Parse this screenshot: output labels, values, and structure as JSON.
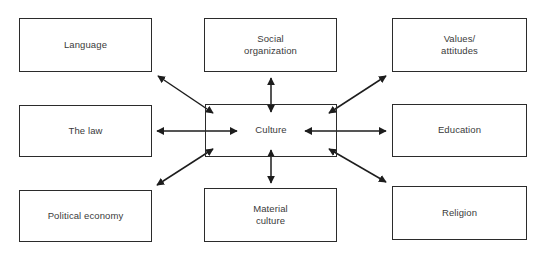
{
  "diagram": {
    "type": "hub-and-spoke",
    "background_color": "#ffffff",
    "line_color": "#2b2b2b",
    "text_color": "#3a3a3a",
    "center": {
      "label": "Culture",
      "x": 205,
      "y": 104,
      "width": 132,
      "height": 53
    },
    "nodes": [
      {
        "id": "language",
        "label": "Language",
        "x": 19,
        "y": 18,
        "width": 133,
        "height": 54,
        "arrow": "double",
        "direction": "diagonal-upper-left"
      },
      {
        "id": "social-organization",
        "label": "Social\norganization",
        "x": 204,
        "y": 18,
        "width": 133,
        "height": 54,
        "arrow": "double",
        "direction": "vertical-up"
      },
      {
        "id": "values-attitudes",
        "label": "Values/\nattitudes",
        "x": 392,
        "y": 18,
        "width": 135,
        "height": 54,
        "arrow": "double",
        "direction": "diagonal-upper-right"
      },
      {
        "id": "the-law",
        "label": "The law",
        "x": 19,
        "y": 105,
        "width": 133,
        "height": 52,
        "arrow": "double",
        "direction": "horizontal-left"
      },
      {
        "id": "education",
        "label": "Education",
        "x": 392,
        "y": 104,
        "width": 135,
        "height": 53,
        "arrow": "double",
        "direction": "horizontal-right"
      },
      {
        "id": "political-economy",
        "label": "Political economy",
        "x": 19,
        "y": 190,
        "width": 133,
        "height": 52,
        "arrow": "double",
        "direction": "diagonal-lower-left"
      },
      {
        "id": "material-culture",
        "label": "Material\nculture",
        "x": 204,
        "y": 188,
        "width": 133,
        "height": 54,
        "arrow": "double",
        "direction": "vertical-down"
      },
      {
        "id": "religion",
        "label": "Religion",
        "x": 392,
        "y": 186,
        "width": 135,
        "height": 54,
        "arrow": "double",
        "direction": "diagonal-lower-right"
      }
    ],
    "connectors": [
      {
        "id": "conn-language",
        "from": "culture",
        "to": "language",
        "heads": "both",
        "x1": 213,
        "y1": 113,
        "x2": 158,
        "y2": 76
      },
      {
        "id": "conn-social-organization",
        "from": "culture",
        "to": "social-organization",
        "heads": "both",
        "x1": 271,
        "y1": 112,
        "x2": 271,
        "y2": 78
      },
      {
        "id": "conn-values-attitudes",
        "from": "culture",
        "to": "values-attitudes",
        "heads": "both",
        "x1": 329,
        "y1": 113,
        "x2": 386,
        "y2": 76
      },
      {
        "id": "conn-the-law",
        "from": "culture",
        "to": "the-law",
        "heads": "both",
        "x1": 237,
        "y1": 131,
        "x2": 157,
        "y2": 131
      },
      {
        "id": "conn-education",
        "from": "culture",
        "to": "education",
        "heads": "both",
        "x1": 305,
        "y1": 131,
        "x2": 386,
        "y2": 131
      },
      {
        "id": "conn-political-economy",
        "from": "culture",
        "to": "political-economy",
        "heads": "both",
        "x1": 213,
        "y1": 149,
        "x2": 157,
        "y2": 185
      },
      {
        "id": "conn-material-culture",
        "from": "culture",
        "to": "material-culture",
        "heads": "both",
        "x1": 271,
        "y1": 150,
        "x2": 271,
        "y2": 183
      },
      {
        "id": "conn-religion",
        "from": "culture",
        "to": "religion",
        "heads": "both",
        "x1": 329,
        "y1": 149,
        "x2": 386,
        "y2": 182
      }
    ]
  }
}
